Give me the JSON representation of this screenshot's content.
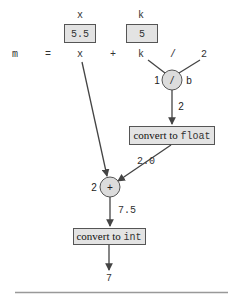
{
  "diagram": {
    "variables": [
      {
        "name": "x",
        "value": "5.5"
      },
      {
        "name": "k",
        "value": "5"
      }
    ],
    "expression": {
      "tokens": [
        "m",
        "=",
        "x",
        "+",
        "k",
        "/",
        "2"
      ]
    },
    "division_node": {
      "operator": "/",
      "order": "1",
      "side_label": "b",
      "output_value": "2"
    },
    "convert_float": {
      "prefix": "convert to ",
      "type": "float",
      "output_value": "2.0"
    },
    "addition_node": {
      "operator": "+",
      "order": "2",
      "output_value": "7.5"
    },
    "convert_int": {
      "prefix": "convert to ",
      "type": "int",
      "output_value": "7"
    }
  }
}
